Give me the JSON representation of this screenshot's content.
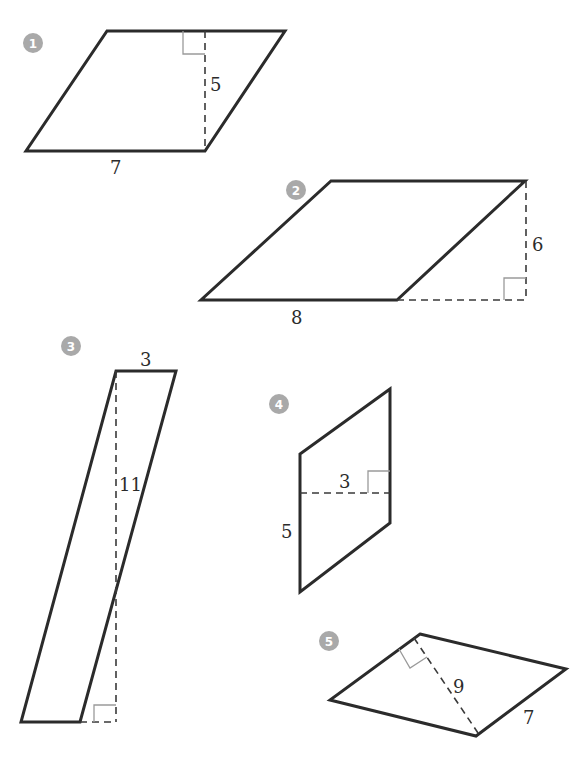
{
  "figures": [
    {
      "number": "1",
      "type": "parallelogram",
      "base_label": "7",
      "height_label": "5"
    },
    {
      "number": "2",
      "type": "parallelogram",
      "base_label": "8",
      "height_label": "6"
    },
    {
      "number": "3",
      "type": "parallelogram",
      "base_label": "3",
      "height_label": "11"
    },
    {
      "number": "4",
      "type": "parallelogram",
      "base_label": "5",
      "height_label": "3"
    },
    {
      "number": "5",
      "type": "parallelogram",
      "base_label": "7",
      "height_label": "9"
    }
  ],
  "colors": {
    "stroke": "#2b2b2b",
    "badge": "#a9a9a9",
    "right_angle": "#9a9a9a"
  }
}
